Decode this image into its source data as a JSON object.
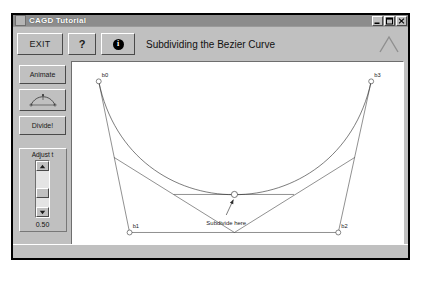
{
  "window": {
    "title": "CAGD Tutorial",
    "sysicon": "system-menu-icon",
    "controls": [
      {
        "name": "minimize-button",
        "glyph": "minimize-icon"
      },
      {
        "name": "maximize-button",
        "glyph": "maximize-icon"
      },
      {
        "name": "close-button",
        "glyph": "close-icon"
      }
    ]
  },
  "toolbar": {
    "exit_label": "EXIT",
    "help_label": "?",
    "info_label": "i",
    "title": "Subdividing the Bezier Curve",
    "logo": "chevron-logo-icon"
  },
  "sidebar": {
    "animate_label": "Animate",
    "curve_icon": "bezier-curve-icon",
    "divide_label": "Divide!",
    "adjust_label": "Adjust t",
    "slider_up": "▲",
    "slider_down": "▼",
    "t_value": "0.50"
  },
  "canvas": {
    "annotation": "Subdivide here",
    "labels": {
      "b0": "b0",
      "b1": "b1",
      "b2": "b2",
      "b3": "b3"
    }
  },
  "chart_data": {
    "type": "line",
    "title": "Subdividing the Bezier Curve",
    "xlabel": "",
    "ylabel": "",
    "xlim": [
      0,
      320
    ],
    "ylim": [
      0,
      188
    ],
    "grid": false,
    "legend": "none",
    "t_parameter": 0.5,
    "control_points": [
      {
        "name": "b0",
        "x": 26,
        "y": 18
      },
      {
        "name": "b1",
        "x": 56,
        "y": 165
      },
      {
        "name": "b2",
        "x": 259,
        "y": 165
      },
      {
        "name": "b3",
        "x": 291,
        "y": 18
      }
    ],
    "first_level_points": [
      {
        "name": "b01",
        "x": 41,
        "y": 92
      },
      {
        "name": "b11",
        "x": 158,
        "y": 165
      },
      {
        "name": "b21",
        "x": 275,
        "y": 92
      }
    ],
    "second_level_points": [
      {
        "name": "b02",
        "x": 99,
        "y": 128
      },
      {
        "name": "b12",
        "x": 216,
        "y": 128
      }
    ],
    "subdivision_point": {
      "name": "b03",
      "x": 158,
      "y": 128
    },
    "polyline_series": [
      {
        "name": "control-polygon",
        "points": [
          [
            26,
            18
          ],
          [
            56,
            165
          ],
          [
            259,
            165
          ],
          [
            291,
            18
          ]
        ]
      },
      {
        "name": "first-level-polygon",
        "points": [
          [
            41,
            92
          ],
          [
            158,
            165
          ],
          [
            275,
            92
          ]
        ]
      },
      {
        "name": "second-level-polygon",
        "points": [
          [
            99,
            128
          ],
          [
            216,
            128
          ]
        ]
      }
    ],
    "curve_series": {
      "name": "bezier-curve",
      "description": "Cubic Bezier from b0 to b3 with control points b1 and b2",
      "start": [
        26,
        18
      ],
      "control1": [
        56,
        165
      ],
      "control2": [
        259,
        165
      ],
      "end": [
        291,
        18
      ]
    },
    "arrow": {
      "from": [
        150,
        148
      ],
      "to": [
        157,
        133
      ]
    }
  }
}
